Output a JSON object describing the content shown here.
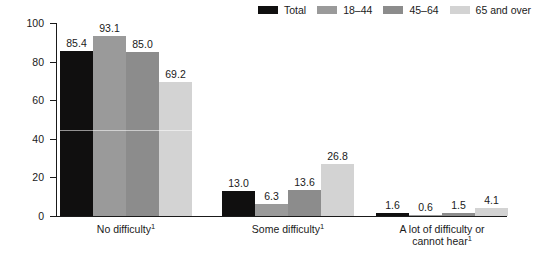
{
  "chart_data": {
    "type": "bar",
    "title": "",
    "subtitle": "",
    "xlabel": "",
    "ylabel": "Percent",
    "ylim": [
      0,
      100
    ],
    "yticks": [
      0,
      20,
      40,
      60,
      80,
      100
    ],
    "ytick_labels": [
      "0",
      "20",
      "40",
      "60",
      "80",
      "100"
    ],
    "grid": false,
    "legend_position": "top-right",
    "categories": [
      "No difficulty¹",
      "Some difficulty¹",
      "A lot of difficulty or cannot hear¹"
    ],
    "category_lines": [
      [
        "No difficulty",
        "1"
      ],
      [
        "Some difficulty",
        "1"
      ],
      [
        "A lot of difficulty or",
        "cannot hear",
        "1"
      ]
    ],
    "series": [
      {
        "name": "Total",
        "color": "#100f0f",
        "values": [
          85.4,
          13.0,
          1.6
        ],
        "value_labels": [
          "85.4",
          "13.0",
          "1.6"
        ]
      },
      {
        "name": "18–44",
        "color": "#9a9a9a",
        "values": [
          93.1,
          6.3,
          0.6
        ],
        "value_labels": [
          "93.1",
          "6.3",
          "0.6"
        ]
      },
      {
        "name": "45–64",
        "color": "#8c8c8c",
        "values": [
          85.0,
          13.6,
          1.5
        ],
        "value_labels": [
          "85.0",
          "13.6",
          "1.5"
        ]
      },
      {
        "name": "65 and over",
        "color": "#d3d3d3",
        "values": [
          69.2,
          26.8,
          4.1
        ],
        "value_labels": [
          "69.2",
          "26.8",
          "4.1"
        ]
      }
    ]
  },
  "legend": {
    "items": [
      {
        "label": "Total",
        "color": "#100f0f"
      },
      {
        "label": "18–44",
        "color": "#9a9a9a"
      },
      {
        "label": "45–64",
        "color": "#8c8c8c"
      },
      {
        "label": "65 and over",
        "color": "#d3d3d3"
      }
    ]
  },
  "axes": {
    "y": {
      "title": "Percent",
      "ticks": [
        {
          "value": 100,
          "label": "100"
        },
        {
          "value": 80,
          "label": "80"
        },
        {
          "value": 60,
          "label": "60"
        },
        {
          "value": 40,
          "label": "40"
        },
        {
          "value": 20,
          "label": "20"
        },
        {
          "value": 0,
          "label": "0"
        }
      ]
    }
  }
}
